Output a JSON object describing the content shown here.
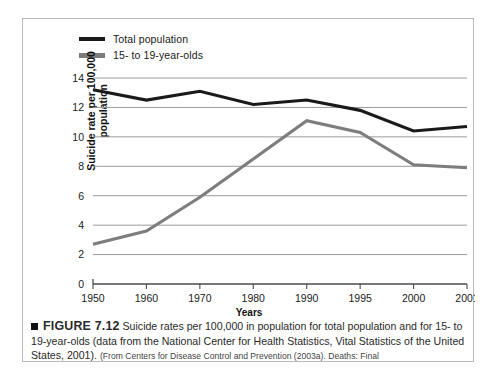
{
  "figure": {
    "bullet_icon": "black-square-bullet",
    "number_label": "FIGURE 7.12",
    "caption_main": " Suicide rates per 100,000 in population for total population and for 15- to 19-year-olds (data from the National Center for Health Statistics, Vital Statistics of the United States, 2001). ",
    "caption_source": "(From Centers for Disease Control and Prevention (2003a). Deaths: Final"
  },
  "colors": {
    "total_population_line": "#1a1a1a",
    "teen_line": "#7d7d7d",
    "gridline": "#9a9a9a",
    "axis": "#4a4a4a",
    "border": "#b9b9b9",
    "text": "#1a1a1a"
  },
  "chart_data": {
    "type": "line",
    "title": "",
    "xlabel": "Years",
    "ylabel": "Suicide rate per 100,000 population",
    "ylabel_line1": "Suicide rate per 100,000",
    "ylabel_line2": "population",
    "categories": [
      "1950",
      "1960",
      "1970",
      "1980",
      "1990",
      "1995",
      "2000",
      "2001"
    ],
    "ylim": [
      0,
      14
    ],
    "yticks": [
      "0",
      "2",
      "4",
      "6",
      "8",
      "10",
      "12",
      "14"
    ],
    "ytick_values": [
      0,
      2,
      4,
      6,
      8,
      10,
      12,
      14
    ],
    "grid": true,
    "grid_axis": "y",
    "legend_position": "top-left",
    "series": [
      {
        "name": "Total population",
        "color": "#1a1a1a",
        "values": [
          13.2,
          12.5,
          13.1,
          12.2,
          12.5,
          11.8,
          10.4,
          10.7
        ]
      },
      {
        "name": "15- to 19-year-olds",
        "color": "#7d7d7d",
        "values": [
          2.7,
          3.6,
          5.9,
          8.5,
          11.1,
          10.3,
          8.1,
          7.9
        ]
      }
    ]
  }
}
